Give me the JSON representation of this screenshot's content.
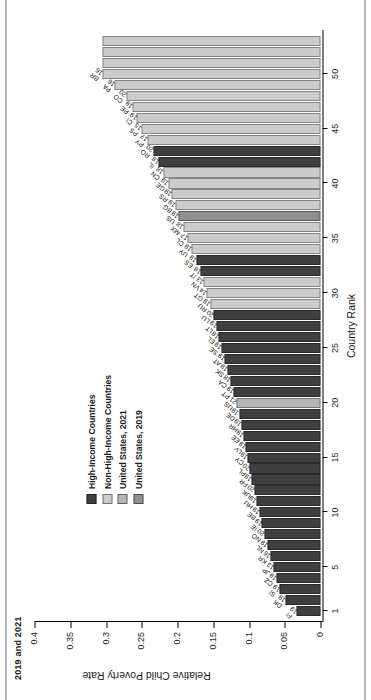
{
  "figure": {
    "title": "2019 and 2021",
    "axis_x_title": "Country Rank",
    "axis_y_title": "Relative Child Poverty Rate"
  },
  "legend": {
    "items": [
      {
        "label": "High-Income Countries",
        "color": "#3f3f3f"
      },
      {
        "label": "Non-High-Income Countries",
        "color": "#cccccc"
      },
      {
        "label": "United States, 2021",
        "color": "#b5b5b5"
      },
      {
        "label": "United States, 2019",
        "color": "#8f8f8f"
      }
    ]
  },
  "chart_data": {
    "type": "bar",
    "title": "2019 and 2021",
    "xlabel": "Country Rank",
    "ylabel": "Relative Child Poverty Rate",
    "xlim": [
      0,
      54
    ],
    "ylim": [
      0,
      0.4
    ],
    "xticks": [
      1,
      5,
      10,
      15,
      20,
      25,
      30,
      35,
      40,
      45,
      50
    ],
    "yticks": [
      0,
      0.05,
      0.1,
      0.15,
      0.2,
      0.25,
      0.3,
      0.35,
      0.4
    ],
    "ytick_labels": [
      "0",
      "0.05",
      "0.1",
      "0.15",
      "0.2",
      "0.25",
      "0.3",
      "0.35",
      "0.4"
    ],
    "grid": false,
    "legend_position": "center-left",
    "series_colors": {
      "high_income": "#3f3f3f",
      "non_high_income": "#cccccc",
      "us_2021": "#b5b5b5",
      "us_2019": "#8f8f8f"
    },
    "categories": [
      1,
      2,
      3,
      4,
      5,
      6,
      7,
      8,
      9,
      10,
      11,
      12,
      13,
      14,
      15,
      16,
      17,
      18,
      19,
      20,
      21,
      22,
      23,
      24,
      25,
      26,
      27,
      28,
      29,
      30,
      31,
      32,
      33,
      34,
      35,
      36,
      37,
      38,
      39,
      40,
      41,
      42,
      43,
      44,
      45,
      46,
      47,
      48,
      49,
      50,
      51,
      52,
      53
    ],
    "points": [
      {
        "rank": 1,
        "code": "FI",
        "year": "19",
        "value": 0.034,
        "group": "high_income"
      },
      {
        "rank": 2,
        "code": "DK",
        "year": "19",
        "value": 0.049,
        "group": "high_income"
      },
      {
        "rank": 3,
        "code": "SI",
        "year": "19",
        "value": 0.058,
        "group": "high_income"
      },
      {
        "rank": 4,
        "code": "CZ",
        "year": "19",
        "value": 0.062,
        "group": "high_income"
      },
      {
        "rank": 5,
        "code": "JP",
        "year": "13",
        "value": 0.066,
        "group": "high_income"
      },
      {
        "rank": 6,
        "code": "KR",
        "year": "16",
        "value": 0.07,
        "group": "high_income"
      },
      {
        "rank": 7,
        "code": "NL",
        "year": "19",
        "value": 0.074,
        "group": "high_income"
      },
      {
        "rank": 8,
        "code": "NO",
        "year": "20",
        "value": 0.078,
        "group": "high_income"
      },
      {
        "rank": 9,
        "code": "IE",
        "year": "19",
        "value": 0.082,
        "group": "high_income"
      },
      {
        "rank": 10,
        "code": "BE",
        "year": "19",
        "value": 0.086,
        "group": "high_income"
      },
      {
        "rank": 11,
        "code": "HU",
        "year": "19",
        "value": 0.09,
        "group": "high_income"
      },
      {
        "rank": 12,
        "code": "UK",
        "year": "20",
        "value": 0.093,
        "group": "high_income"
      },
      {
        "rank": 13,
        "code": "FR",
        "year": "19",
        "value": 0.096,
        "group": "high_income"
      },
      {
        "rank": 14,
        "code": "PL",
        "year": "20",
        "value": 0.099,
        "group": "high_income"
      },
      {
        "rank": 15,
        "code": "CY",
        "year": "19",
        "value": 0.102,
        "group": "high_income"
      },
      {
        "rank": 16,
        "code": "LV",
        "year": "19",
        "value": 0.105,
        "group": "high_income"
      },
      {
        "rank": 17,
        "code": "EE",
        "year": "19",
        "value": 0.108,
        "group": "high_income"
      },
      {
        "rank": 18,
        "code": "HR",
        "year": "19",
        "value": 0.111,
        "group": "high_income"
      },
      {
        "rank": 19,
        "code": "DE",
        "year": "19",
        "value": 0.114,
        "group": "high_income"
      },
      {
        "rank": 20,
        "code": "US",
        "year": "21",
        "value": 0.118,
        "group": "us_2021"
      },
      {
        "rank": 21,
        "code": "PT",
        "year": "19",
        "value": 0.122,
        "group": "high_income"
      },
      {
        "rank": 22,
        "code": "CA",
        "year": "18",
        "value": 0.126,
        "group": "high_income"
      },
      {
        "rank": 23,
        "code": "SK",
        "year": "19",
        "value": 0.13,
        "group": "high_income"
      },
      {
        "rank": 24,
        "code": "AT",
        "year": "19",
        "value": 0.134,
        "group": "high_income"
      },
      {
        "rank": 25,
        "code": "SE",
        "year": "19",
        "value": 0.138,
        "group": "high_income"
      },
      {
        "rank": 26,
        "code": "EL",
        "year": "18",
        "value": 0.142,
        "group": "high_income"
      },
      {
        "rank": 27,
        "code": "LT",
        "year": "19",
        "value": 0.146,
        "group": "high_income"
      },
      {
        "rank": 28,
        "code": "LU",
        "year": "20",
        "value": 0.15,
        "group": "high_income"
      },
      {
        "rank": 29,
        "code": "RU",
        "year": "19",
        "value": 0.154,
        "group": "non_high_income"
      },
      {
        "rank": 30,
        "code": "GT",
        "year": "14",
        "value": 0.159,
        "group": "non_high_income"
      },
      {
        "rank": 31,
        "code": "VN",
        "year": "13",
        "value": 0.163,
        "group": "non_high_income"
      },
      {
        "rank": 32,
        "code": "IT",
        "year": "18",
        "value": 0.168,
        "group": "high_income"
      },
      {
        "rank": 33,
        "code": "ES",
        "year": "19",
        "value": 0.174,
        "group": "high_income"
      },
      {
        "rank": 34,
        "code": "UY",
        "year": "19",
        "value": 0.18,
        "group": "non_high_income"
      },
      {
        "rank": 35,
        "code": "CL",
        "year": "17",
        "value": 0.186,
        "group": "non_high_income"
      },
      {
        "rank": 36,
        "code": "MX",
        "year": "18",
        "value": 0.192,
        "group": "non_high_income"
      },
      {
        "rank": 37,
        "code": "US",
        "year": "19",
        "value": 0.198,
        "group": "us_2019"
      },
      {
        "rank": 38,
        "code": "BG",
        "year": "19",
        "value": 0.203,
        "group": "non_high_income"
      },
      {
        "rank": 39,
        "code": "RS",
        "year": "19",
        "value": 0.208,
        "group": "non_high_income"
      },
      {
        "rank": 40,
        "code": "GE",
        "year": "19",
        "value": 0.213,
        "group": "non_high_income"
      },
      {
        "rank": 41,
        "code": "CN",
        "year": "18",
        "value": 0.219,
        "group": "non_high_income"
      },
      {
        "rank": 42,
        "code": "IL",
        "year": "18",
        "value": 0.226,
        "group": "high_income"
      },
      {
        "rank": 43,
        "code": "RO",
        "year": "20",
        "value": 0.234,
        "group": "high_income"
      },
      {
        "rank": 44,
        "code": "PY",
        "year": "17",
        "value": 0.242,
        "group": "non_high_income"
      },
      {
        "rank": 45,
        "code": "PS",
        "year": "15",
        "value": 0.25,
        "group": "non_high_income"
      },
      {
        "rank": 46,
        "code": "CI",
        "year": "19",
        "value": 0.257,
        "group": "non_high_income"
      },
      {
        "rank": 47,
        "code": "PE",
        "year": "19",
        "value": 0.263,
        "group": "non_high_income"
      },
      {
        "rank": 48,
        "code": "CO",
        "year": "20",
        "value": 0.272,
        "group": "non_high_income"
      },
      {
        "rank": 49,
        "code": "PA",
        "year": "16",
        "value": 0.288,
        "group": "non_high_income"
      },
      {
        "rank": 50,
        "code": "BR",
        "year": "16",
        "value": 0.305,
        "group": "non_high_income"
      },
      {
        "rank": 51,
        "code": "",
        "year": "",
        "value": 0.305,
        "group": "non_high_income"
      },
      {
        "rank": 52,
        "code": "",
        "year": "",
        "value": 0.305,
        "group": "non_high_income"
      },
      {
        "rank": 53,
        "code": "",
        "year": "",
        "value": 0.305,
        "group": "non_high_income"
      }
    ]
  }
}
